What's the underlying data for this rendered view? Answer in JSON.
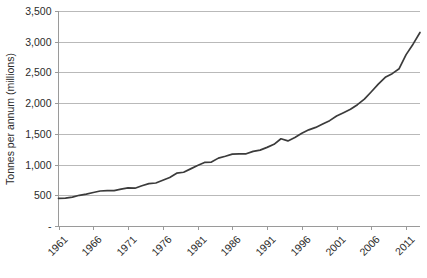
{
  "chart_data": {
    "type": "line",
    "title": "",
    "xlabel": "",
    "ylabel": "Tonnes per annum (millions)",
    "xlim": [
      1961,
      2013
    ],
    "ylim": [
      0,
      3500
    ],
    "grid": true,
    "legend": false,
    "legend_position": "none",
    "y_ticks": [
      0,
      500,
      1000,
      1500,
      2000,
      2500,
      3000,
      3500
    ],
    "y_tick_labels": [
      "-",
      "500",
      "1,000",
      "1,500",
      "2,000",
      "2,500",
      "3,000",
      "3,500"
    ],
    "x_ticks": [
      1961,
      1966,
      1971,
      1976,
      1981,
      1986,
      1991,
      1996,
      2001,
      2006,
      2011
    ],
    "x_tick_labels": [
      "1961",
      "1966",
      "1971",
      "1976",
      "1981",
      "1986",
      "1991",
      "1996",
      "2001",
      "2006",
      "2011"
    ],
    "series": [
      {
        "name": "Tonnes per annum",
        "color": "#3b3b3b",
        "x": [
          1961,
          1962,
          1963,
          1964,
          1965,
          1966,
          1967,
          1968,
          1969,
          1970,
          1971,
          1972,
          1973,
          1974,
          1975,
          1976,
          1977,
          1978,
          1979,
          1980,
          1981,
          1982,
          1983,
          1984,
          1985,
          1986,
          1987,
          1988,
          1989,
          1990,
          1991,
          1992,
          1993,
          1994,
          1995,
          1996,
          1997,
          1998,
          1999,
          2000,
          2001,
          2002,
          2003,
          2004,
          2005,
          2006,
          2007,
          2008,
          2009,
          2010,
          2011,
          2012,
          2013
        ],
        "values": [
          450,
          455,
          470,
          500,
          520,
          545,
          570,
          575,
          575,
          600,
          620,
          615,
          655,
          690,
          700,
          745,
          790,
          860,
          875,
          930,
          985,
          1035,
          1040,
          1105,
          1135,
          1170,
          1175,
          1175,
          1215,
          1235,
          1280,
          1330,
          1420,
          1385,
          1440,
          1510,
          1565,
          1605,
          1660,
          1715,
          1790,
          1845,
          1900,
          1975,
          2065,
          2185,
          2310,
          2420,
          2480,
          2560,
          2790,
          2960,
          3150
        ]
      }
    ]
  },
  "axes": {
    "y_axis_title": "Tonnes per annum (millions)"
  }
}
